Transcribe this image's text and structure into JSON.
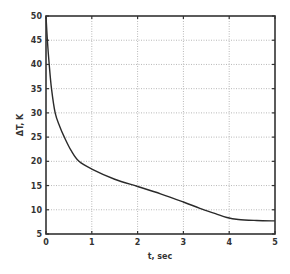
{
  "chart_data": {
    "type": "line",
    "title": "",
    "xlabel": "t, sec",
    "ylabel": "ΔT, K",
    "xlim": [
      0,
      5
    ],
    "ylim": [
      5,
      50
    ],
    "grid": true,
    "legend": null,
    "x_ticks": [
      "0",
      "1",
      "2",
      "3",
      "4",
      "5"
    ],
    "y_ticks": [
      "5",
      "10",
      "15",
      "20",
      "25",
      "30",
      "35",
      "40",
      "45",
      "50"
    ],
    "series": [
      {
        "name": "ΔT(t)",
        "x": [
          0,
          0.03,
          0.07,
          0.12,
          0.2,
          0.3,
          0.4,
          0.55,
          0.72,
          1.0,
          1.5,
          2.0,
          2.5,
          3.0,
          3.36,
          3.7,
          3.95,
          4.2,
          4.6,
          5.0
        ],
        "y": [
          50,
          45,
          40,
          35,
          30,
          27.2,
          25,
          22.2,
          20,
          18.4,
          16.3,
          14.8,
          13.3,
          11.6,
          10.3,
          9.2,
          8.4,
          8.0,
          7.8,
          7.7
        ]
      }
    ]
  },
  "colors": {
    "curve": "#2a2a2a",
    "axis": "#333333",
    "grid": "#b8b8b8"
  }
}
